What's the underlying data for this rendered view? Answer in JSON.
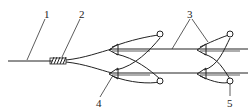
{
  "diagram": {
    "type": "fiber-optic branching schematic",
    "labels": [
      {
        "id": "1",
        "text": "1",
        "refers_to": "input fiber line"
      },
      {
        "id": "2",
        "text": "2",
        "refers_to": "coil / winding on fiber"
      },
      {
        "id": "3",
        "text": "3",
        "refers_to": "output horizontal lines"
      },
      {
        "id": "4",
        "text": "4",
        "refers_to": "first coupler arrowhead"
      },
      {
        "id": "5",
        "text": "5",
        "refers_to": "end loop terminal circle"
      }
    ],
    "colors": {
      "stroke": "#222222",
      "background": "#ffffff"
    }
  }
}
